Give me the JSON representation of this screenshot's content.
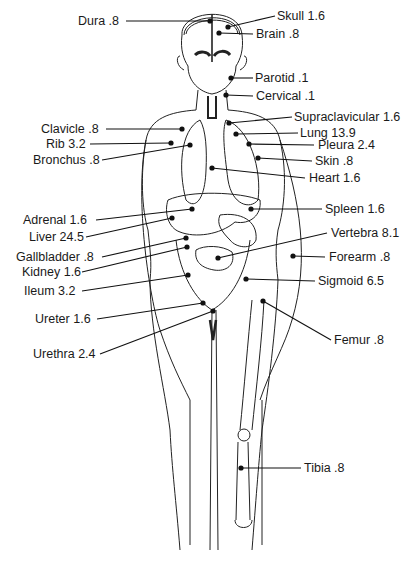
{
  "diagram": {
    "type": "anatomical-figure",
    "signature": "TdW",
    "labels": [
      {
        "id": "dura",
        "text": "Dura .8",
        "organ": "Dura",
        "value": 0.8,
        "side": "left",
        "tx": 78,
        "ty": 14,
        "px": 210,
        "py": 21,
        "lx": 126
      },
      {
        "id": "skull",
        "text": "Skull 1.6",
        "organ": "Skull",
        "value": 1.6,
        "side": "right",
        "tx": 277,
        "ty": 9,
        "px": 228,
        "py": 27,
        "lx": 275
      },
      {
        "id": "brain",
        "text": "Brain .8",
        "organ": "Brain",
        "value": 0.8,
        "side": "right",
        "tx": 256,
        "ty": 27,
        "px": 219,
        "py": 33,
        "lx": 253
      },
      {
        "id": "parotid",
        "text": "Parotid .1",
        "organ": "Parotid",
        "value": 0.1,
        "side": "right",
        "tx": 255,
        "ty": 71,
        "px": 231,
        "py": 78,
        "lx": 253
      },
      {
        "id": "cervical",
        "text": "Cervical .1",
        "organ": "Cervical",
        "value": 0.1,
        "side": "right",
        "tx": 256,
        "ty": 89,
        "px": 226,
        "py": 95,
        "lx": 253
      },
      {
        "id": "supraclavicular",
        "text": "Supraclavicular 1.6",
        "organ": "Supraclavicular",
        "value": 1.6,
        "side": "right",
        "tx": 294,
        "ty": 110,
        "px": 229,
        "py": 123,
        "lx": 292
      },
      {
        "id": "clavicle",
        "text": "Clavicle .8",
        "organ": "Clavicle",
        "value": 0.8,
        "side": "left",
        "tx": 41,
        "ty": 122,
        "px": 182,
        "py": 129,
        "lx": 106
      },
      {
        "id": "lung",
        "text": "Lung 13.9",
        "organ": "Lung",
        "value": 13.9,
        "side": "right",
        "tx": 300,
        "ty": 126,
        "px": 236,
        "py": 134,
        "lx": 298
      },
      {
        "id": "rib",
        "text": "Rib 3.2",
        "organ": "Rib",
        "value": 3.2,
        "side": "left",
        "tx": 46,
        "ty": 137,
        "px": 171,
        "py": 143,
        "lx": 90
      },
      {
        "id": "pleura",
        "text": "Pleura 2.4",
        "organ": "Pleura",
        "value": 2.4,
        "side": "right",
        "tx": 318,
        "ty": 138,
        "px": 249,
        "py": 144,
        "lx": 314
      },
      {
        "id": "bronchus",
        "text": "Bronchus .8",
        "organ": "Bronchus",
        "value": 0.8,
        "side": "left",
        "tx": 33,
        "ty": 153,
        "px": 190,
        "py": 145,
        "lx": 102
      },
      {
        "id": "skin",
        "text": "Skin .8",
        "organ": "Skin",
        "value": 0.8,
        "side": "right",
        "tx": 315,
        "ty": 154,
        "px": 258,
        "py": 158,
        "lx": 312
      },
      {
        "id": "heart",
        "text": "Heart 1.6",
        "organ": "Heart",
        "value": 1.6,
        "side": "right",
        "tx": 309,
        "ty": 171,
        "px": 212,
        "py": 168,
        "lx": 305
      },
      {
        "id": "spleen",
        "text": "Spleen 1.6",
        "organ": "Spleen",
        "value": 1.6,
        "side": "right",
        "tx": 325,
        "ty": 202,
        "px": 251,
        "py": 209,
        "lx": 322
      },
      {
        "id": "adrenal",
        "text": "Adrenal 1.6",
        "organ": "Adrenal",
        "value": 1.6,
        "side": "left",
        "tx": 23,
        "ty": 213,
        "px": 192,
        "py": 209,
        "lx": 96
      },
      {
        "id": "liver",
        "text": "Liver 24.5",
        "organ": "Liver",
        "value": 24.5,
        "side": "left",
        "tx": 29,
        "ty": 230,
        "px": 172,
        "py": 218,
        "lx": 86
      },
      {
        "id": "vertebra",
        "text": "Vertebra 8.1",
        "organ": "Vertebra",
        "value": 8.1,
        "side": "right",
        "tx": 331,
        "ty": 226,
        "px": 218,
        "py": 258,
        "lx": 327
      },
      {
        "id": "gallbladder",
        "text": "Gallbladder .8",
        "organ": "Gallbladder",
        "value": 0.8,
        "side": "left",
        "tx": 16,
        "ty": 250,
        "px": 186,
        "py": 238,
        "lx": 102
      },
      {
        "id": "forearm",
        "text": "Forearm .8",
        "organ": "Forearm",
        "value": 0.8,
        "side": "right",
        "tx": 329,
        "ty": 250,
        "px": 293,
        "py": 256,
        "lx": 325
      },
      {
        "id": "kidney",
        "text": "Kidney 1.6",
        "organ": "Kidney",
        "value": 1.6,
        "side": "left",
        "tx": 22,
        "ty": 265,
        "px": 187,
        "py": 247,
        "lx": 82
      },
      {
        "id": "sigmoid",
        "text": "Sigmoid 6.5",
        "organ": "Sigmoid",
        "value": 6.5,
        "side": "right",
        "tx": 318,
        "ty": 274,
        "px": 246,
        "py": 279,
        "lx": 315
      },
      {
        "id": "ileum",
        "text": "Ileum 3.2",
        "organ": "Ileum",
        "value": 3.2,
        "side": "left",
        "tx": 24,
        "ty": 284,
        "px": 188,
        "py": 275,
        "lx": 82
      },
      {
        "id": "ureter",
        "text": "Ureter 1.6",
        "organ": "Ureter",
        "value": 1.6,
        "side": "left",
        "tx": 35,
        "ty": 312,
        "px": 203,
        "py": 303,
        "lx": 97
      },
      {
        "id": "femur",
        "text": "Femur .8",
        "organ": "Femur",
        "value": 0.8,
        "side": "right",
        "tx": 334,
        "ty": 333,
        "px": 263,
        "py": 301,
        "lx": 331
      },
      {
        "id": "urethra",
        "text": "Urethra 2.4",
        "organ": "Urethra",
        "value": 2.4,
        "side": "left",
        "tx": 33,
        "ty": 347,
        "px": 213,
        "py": 311,
        "lx": 100
      },
      {
        "id": "tibia",
        "text": "Tibia .8",
        "organ": "Tibia",
        "value": 0.8,
        "side": "right",
        "tx": 304,
        "ty": 461,
        "px": 241,
        "py": 468,
        "lx": 301
      }
    ]
  }
}
